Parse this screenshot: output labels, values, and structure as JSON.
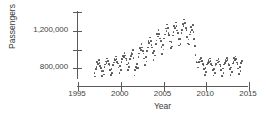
{
  "chart_data": {
    "type": "scatter",
    "title": "",
    "xlabel": "Year",
    "ylabel": "Passengers",
    "xlim": [
      1995,
      2015
    ],
    "ylim": [
      600000,
      1400000
    ],
    "grid": false,
    "legend": null,
    "x_ticks": [
      1995,
      2000,
      2005,
      2010,
      2015
    ],
    "x_tick_labels": [
      "1995",
      "2000",
      "2005",
      "2010",
      "2015"
    ],
    "y_ticks": [
      800000,
      1000000,
      1200000,
      1400000
    ],
    "y_tick_labels": [
      "800,000",
      "",
      "1,200,000",
      ""
    ],
    "y_tick_labels_visible": [
      "800,000",
      "1,200,000"
    ],
    "marker": "filled-circle",
    "marker_color": "#4d4d4d",
    "marker_size_px": 1.7,
    "points": [
      [
        1997.04,
        742000
      ],
      [
        1997.12,
        700000
      ],
      [
        1997.21,
        781000
      ],
      [
        1997.29,
        806000
      ],
      [
        1997.37,
        856000
      ],
      [
        1997.46,
        835000
      ],
      [
        1997.54,
        880000
      ],
      [
        1997.62,
        845000
      ],
      [
        1997.71,
        812000
      ],
      [
        1997.79,
        795000
      ],
      [
        1997.87,
        757000
      ],
      [
        1997.96,
        703000
      ],
      [
        1998.04,
        761000
      ],
      [
        1998.12,
        723000
      ],
      [
        1998.21,
        800000
      ],
      [
        1998.29,
        828000
      ],
      [
        1998.37,
        861000
      ],
      [
        1998.46,
        848000
      ],
      [
        1998.54,
        892000
      ],
      [
        1998.62,
        866000
      ],
      [
        1998.71,
        836000
      ],
      [
        1998.79,
        818000
      ],
      [
        1998.87,
        772000
      ],
      [
        1998.96,
        716000
      ],
      [
        1999.04,
        784000
      ],
      [
        1999.12,
        742000
      ],
      [
        1999.21,
        823000
      ],
      [
        1999.29,
        852000
      ],
      [
        1999.37,
        888000
      ],
      [
        1999.46,
        874000
      ],
      [
        1999.54,
        916000
      ],
      [
        1999.62,
        889000
      ],
      [
        1999.71,
        858000
      ],
      [
        1999.79,
        840000
      ],
      [
        1999.87,
        796000
      ],
      [
        1999.96,
        738000
      ],
      [
        2000.04,
        812000
      ],
      [
        2000.12,
        770000
      ],
      [
        2000.21,
        856000
      ],
      [
        2000.29,
        886000
      ],
      [
        2000.37,
        922000
      ],
      [
        2000.46,
        908000
      ],
      [
        2000.54,
        952000
      ],
      [
        2000.62,
        925000
      ],
      [
        2000.71,
        894000
      ],
      [
        2000.79,
        874000
      ],
      [
        2000.87,
        830000
      ],
      [
        2000.96,
        772000
      ],
      [
        2001.04,
        846000
      ],
      [
        2001.12,
        802000
      ],
      [
        2001.21,
        891000
      ],
      [
        2001.29,
        918000
      ],
      [
        2001.37,
        958000
      ],
      [
        2001.46,
        941000
      ],
      [
        2001.54,
        986000
      ],
      [
        2001.62,
        900000
      ],
      [
        2001.71,
        712000
      ],
      [
        2001.79,
        768000
      ],
      [
        2001.87,
        806000
      ],
      [
        2001.96,
        790000
      ],
      [
        2002.04,
        835000
      ],
      [
        2002.12,
        790000
      ],
      [
        2002.21,
        912000
      ],
      [
        2002.29,
        948000
      ],
      [
        2002.37,
        1002000
      ],
      [
        2002.46,
        985000
      ],
      [
        2002.54,
        1046000
      ],
      [
        2002.62,
        1010000
      ],
      [
        2002.71,
        970000
      ],
      [
        2002.79,
        948000
      ],
      [
        2002.87,
        892000
      ],
      [
        2002.96,
        826000
      ],
      [
        2003.04,
        908000
      ],
      [
        2003.12,
        862000
      ],
      [
        2003.21,
        975000
      ],
      [
        2003.29,
        1012000
      ],
      [
        2003.37,
        1078000
      ],
      [
        2003.46,
        1055000
      ],
      [
        2003.54,
        1118000
      ],
      [
        2003.62,
        1080000
      ],
      [
        2003.71,
        1036000
      ],
      [
        2003.79,
        1012000
      ],
      [
        2003.87,
        950000
      ],
      [
        2003.96,
        880000
      ],
      [
        2004.04,
        972000
      ],
      [
        2004.12,
        924000
      ],
      [
        2004.21,
        1046000
      ],
      [
        2004.29,
        1086000
      ],
      [
        2004.37,
        1152000
      ],
      [
        2004.46,
        1128000
      ],
      [
        2004.54,
        1196000
      ],
      [
        2004.62,
        1158000
      ],
      [
        2004.71,
        1108000
      ],
      [
        2004.79,
        1082000
      ],
      [
        2004.87,
        1018000
      ],
      [
        2004.96,
        944000
      ],
      [
        2005.04,
        1038000
      ],
      [
        2005.12,
        988000
      ],
      [
        2005.21,
        1108000
      ],
      [
        2005.29,
        1148000
      ],
      [
        2005.37,
        1214000
      ],
      [
        2005.46,
        1190000
      ],
      [
        2005.54,
        1256000
      ],
      [
        2005.62,
        1218000
      ],
      [
        2005.71,
        1168000
      ],
      [
        2005.79,
        1142000
      ],
      [
        2005.87,
        1076000
      ],
      [
        2005.96,
        1002000
      ],
      [
        2006.04,
        1072000
      ],
      [
        2006.12,
        1020000
      ],
      [
        2006.21,
        1140000
      ],
      [
        2006.29,
        1178000
      ],
      [
        2006.37,
        1238000
      ],
      [
        2006.46,
        1216000
      ],
      [
        2006.54,
        1278000
      ],
      [
        2006.62,
        1242000
      ],
      [
        2006.71,
        1192000
      ],
      [
        2006.79,
        1168000
      ],
      [
        2006.87,
        1104000
      ],
      [
        2006.96,
        1032000
      ],
      [
        2007.04,
        1098000
      ],
      [
        2007.12,
        1046000
      ],
      [
        2007.21,
        1162000
      ],
      [
        2007.29,
        1200000
      ],
      [
        2007.37,
        1262000
      ],
      [
        2007.46,
        1242000
      ],
      [
        2007.54,
        1308000
      ],
      [
        2007.62,
        1272000
      ],
      [
        2007.71,
        1220000
      ],
      [
        2007.79,
        1194000
      ],
      [
        2007.87,
        1126000
      ],
      [
        2007.96,
        1052000
      ],
      [
        2008.04,
        1096000
      ],
      [
        2008.12,
        1042000
      ],
      [
        2008.21,
        1148000
      ],
      [
        2008.29,
        1178000
      ],
      [
        2008.37,
        1226000
      ],
      [
        2008.46,
        1200000
      ],
      [
        2008.54,
        1248000
      ],
      [
        2008.62,
        1178000
      ],
      [
        2008.71,
        1098000
      ],
      [
        2008.79,
        1026000
      ],
      [
        2008.87,
        930000
      ],
      [
        2008.96,
        856000
      ],
      [
        2009.04,
        852000
      ],
      [
        2009.12,
        796000
      ],
      [
        2009.21,
        850000
      ],
      [
        2009.29,
        858000
      ],
      [
        2009.37,
        884000
      ],
      [
        2009.46,
        862000
      ],
      [
        2009.54,
        896000
      ],
      [
        2009.62,
        868000
      ],
      [
        2009.71,
        838000
      ],
      [
        2009.79,
        826000
      ],
      [
        2009.87,
        778000
      ],
      [
        2009.96,
        718000
      ],
      [
        2010.04,
        790000
      ],
      [
        2010.12,
        746000
      ],
      [
        2010.21,
        828000
      ],
      [
        2010.29,
        842000
      ],
      [
        2010.37,
        874000
      ],
      [
        2010.46,
        856000
      ],
      [
        2010.54,
        892000
      ],
      [
        2010.62,
        864000
      ],
      [
        2010.71,
        832000
      ],
      [
        2010.79,
        820000
      ],
      [
        2010.87,
        772000
      ],
      [
        2010.96,
        712000
      ],
      [
        2011.04,
        782000
      ],
      [
        2011.12,
        738000
      ],
      [
        2011.21,
        820000
      ],
      [
        2011.29,
        838000
      ],
      [
        2011.37,
        872000
      ],
      [
        2011.46,
        852000
      ],
      [
        2011.54,
        890000
      ],
      [
        2011.62,
        862000
      ],
      [
        2011.71,
        828000
      ],
      [
        2011.79,
        816000
      ],
      [
        2011.87,
        768000
      ],
      [
        2011.96,
        708000
      ],
      [
        2012.04,
        788000
      ],
      [
        2012.12,
        742000
      ],
      [
        2012.21,
        828000
      ],
      [
        2012.29,
        846000
      ],
      [
        2012.37,
        882000
      ],
      [
        2012.46,
        864000
      ],
      [
        2012.54,
        902000
      ],
      [
        2012.62,
        874000
      ],
      [
        2012.71,
        840000
      ],
      [
        2012.79,
        826000
      ],
      [
        2012.87,
        778000
      ],
      [
        2012.96,
        718000
      ],
      [
        2013.04,
        798000
      ],
      [
        2013.12,
        752000
      ],
      [
        2013.21,
        840000
      ],
      [
        2013.29,
        858000
      ],
      [
        2013.37,
        896000
      ],
      [
        2013.46,
        876000
      ],
      [
        2013.54,
        916000
      ],
      [
        2013.62,
        886000
      ],
      [
        2013.71,
        852000
      ],
      [
        2013.79,
        838000
      ],
      [
        2013.87,
        788000
      ],
      [
        2013.96,
        726000
      ],
      [
        2014.04,
        806000
      ],
      [
        2014.12,
        760000
      ],
      [
        2014.21,
        846000
      ],
      [
        2014.29,
        864000
      ]
    ]
  }
}
